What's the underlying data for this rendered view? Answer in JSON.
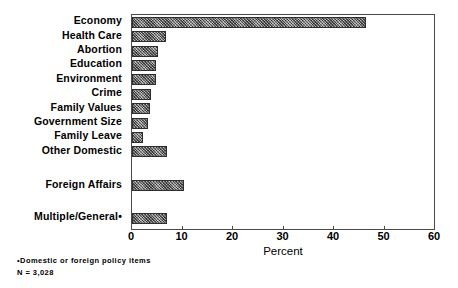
{
  "chart_data": {
    "type": "bar",
    "orientation": "horizontal",
    "title": "",
    "xlabel": "Percent",
    "ylabel": "",
    "xlim": [
      0,
      60
    ],
    "xticks": [
      0,
      10,
      20,
      30,
      40,
      50,
      60
    ],
    "grid": false,
    "legend": null,
    "categories": [
      "Economy",
      "Health Care",
      "Abortion",
      "Education",
      "Environment",
      "Crime",
      "Family Values",
      "Government Size",
      "Family Leave",
      "Other Domestic",
      "Foreign Affairs",
      "Multiple/General•"
    ],
    "values": [
      46.3,
      6.7,
      5.1,
      4.8,
      4.8,
      3.8,
      3.6,
      3.2,
      2.2,
      6.9,
      10.3,
      7.0
    ],
    "bar_color": "#8a8a8a",
    "bar_pattern": "cross-hatch"
  },
  "footnotes": [
    "•Domestic or foreign policy items",
    "N = 3,028"
  ]
}
